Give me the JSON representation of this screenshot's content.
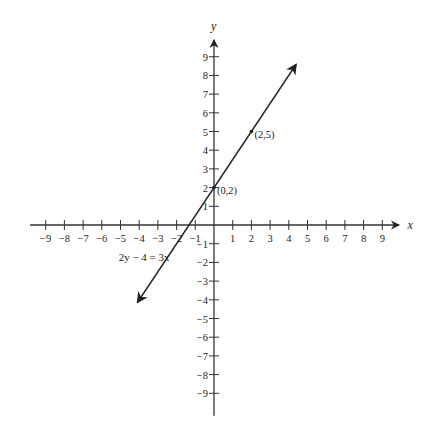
{
  "chart_data": {
    "type": "line",
    "title": "",
    "xlabel": "x",
    "ylabel": "y",
    "xlim": [
      -9,
      9
    ],
    "ylim": [
      -9,
      9
    ],
    "grid": false,
    "x_ticks": [
      -9,
      -8,
      -7,
      -6,
      -5,
      -4,
      -3,
      -2,
      -1,
      1,
      2,
      3,
      4,
      5,
      6,
      7,
      8,
      9
    ],
    "y_ticks": [
      9,
      8,
      7,
      6,
      5,
      4,
      3,
      2,
      1,
      -1,
      -2,
      -3,
      -4,
      -5,
      -6,
      -7,
      -8,
      -9
    ],
    "series": [
      {
        "name": "2y − 4 = 3x",
        "equation": "2y - 4 = 3x",
        "slope": 1.5,
        "intercept": 2,
        "x_range": [
          -4.1,
          4.4
        ],
        "arrows": "both"
      }
    ],
    "points": [
      {
        "x": 0,
        "y": 2,
        "label": "(0,2)"
      },
      {
        "x": 2,
        "y": 5,
        "label": "(2,5)"
      }
    ],
    "annotations": [
      {
        "text": "2y − 4 = 3x",
        "x": -5.1,
        "y": -1.9
      }
    ]
  },
  "labels": {
    "x_axis": "x",
    "y_axis": "y",
    "equation": "2y − 4 = 3x",
    "point_a": "(0,2)",
    "point_b": "(2,5)"
  }
}
